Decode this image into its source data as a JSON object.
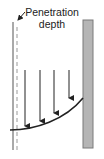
{
  "diagram": {
    "label_line1": "Penetration",
    "label_line2": "depth",
    "colors": {
      "line": "#222222",
      "dashed": "#999999",
      "wall_fill": "#b5b5b5",
      "wall_edge": "#7a7a7a"
    },
    "arrows": [
      {
        "x": 25,
        "y_top": 70,
        "y_bottom": 126
      },
      {
        "x": 40,
        "y_top": 70,
        "y_bottom": 121
      },
      {
        "x": 54,
        "y_top": 70,
        "y_bottom": 113
      },
      {
        "x": 69,
        "y_top": 70,
        "y_bottom": 98
      }
    ]
  }
}
